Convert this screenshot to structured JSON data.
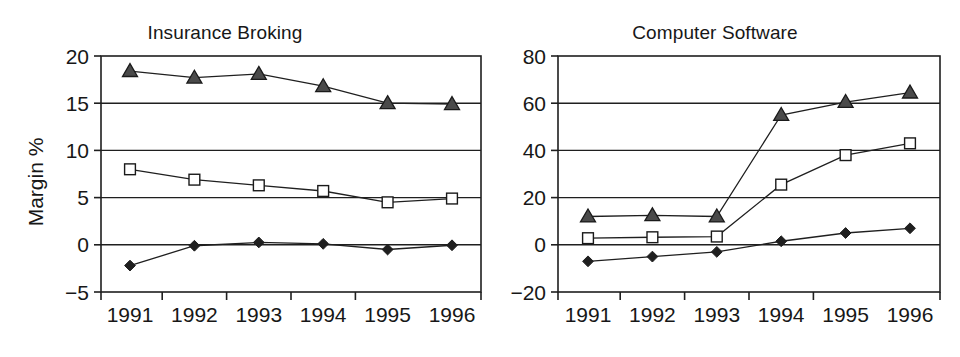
{
  "figure": {
    "axis_title_y": "Margin %",
    "categories": [
      "1991",
      "1992",
      "1993",
      "1994",
      "1995",
      "1996"
    ],
    "colors": {
      "ink": "#1f1f1f",
      "marker_shaded": "#4a4a4a",
      "marker_open_fill": "#ffffff",
      "background": "#ffffff"
    }
  },
  "chart_data": [
    {
      "type": "line",
      "title": "Insurance Broking",
      "xlabel": "",
      "ylabel": "Margin %",
      "categories": [
        "1991",
        "1992",
        "1993",
        "1994",
        "1995",
        "1996"
      ],
      "ylim": [
        -5,
        20
      ],
      "yticks": [
        -5,
        0,
        5,
        10,
        15,
        20
      ],
      "ytick_labels": [
        "−5",
        "0",
        "5",
        "10",
        "15",
        "20"
      ],
      "grid": true,
      "legend": "none",
      "series": [
        {
          "name": "triangle-series",
          "marker": "triangle",
          "values": [
            18.4,
            17.7,
            18.1,
            16.8,
            15.0,
            14.9
          ]
        },
        {
          "name": "square-series",
          "marker": "square",
          "values": [
            8.0,
            6.9,
            6.3,
            5.7,
            4.5,
            4.9
          ]
        },
        {
          "name": "diamond-series",
          "marker": "diamond",
          "values": [
            -2.2,
            -0.1,
            0.25,
            0.1,
            -0.5,
            -0.05
          ]
        }
      ]
    },
    {
      "type": "line",
      "title": "Computer Software",
      "xlabel": "",
      "ylabel": "",
      "categories": [
        "1991",
        "1992",
        "1993",
        "1994",
        "1995",
        "1996"
      ],
      "ylim": [
        -20,
        80
      ],
      "yticks": [
        -20,
        0,
        20,
        40,
        60,
        80
      ],
      "ytick_labels": [
        "−20",
        "0",
        "20",
        "40",
        "60",
        "80"
      ],
      "grid": true,
      "legend": "none",
      "series": [
        {
          "name": "triangle-series",
          "marker": "triangle",
          "values": [
            12.0,
            12.5,
            12.0,
            55.0,
            60.5,
            64.5
          ]
        },
        {
          "name": "square-series",
          "marker": "square",
          "values": [
            2.8,
            3.2,
            3.5,
            25.5,
            38.0,
            43.0
          ]
        },
        {
          "name": "diamond-series",
          "marker": "diamond",
          "values": [
            -7.0,
            -5.0,
            -3.0,
            1.5,
            5.0,
            7.0
          ]
        }
      ]
    }
  ]
}
